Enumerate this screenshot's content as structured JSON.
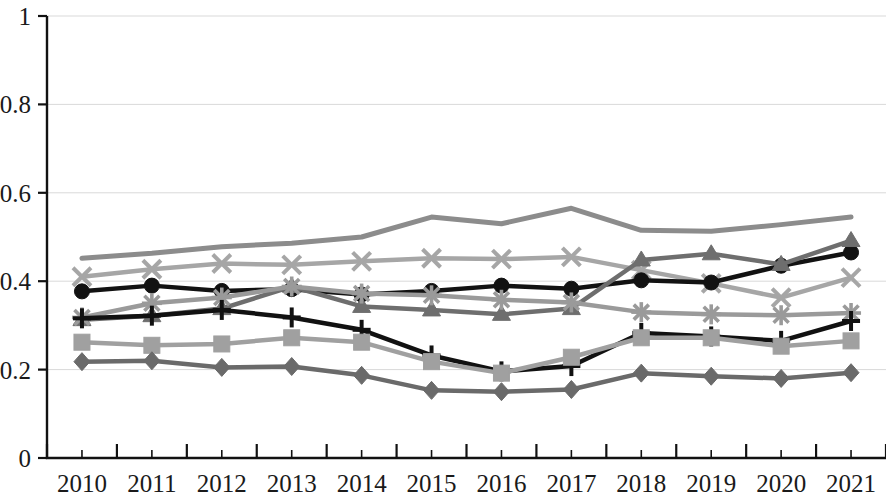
{
  "chart_data": {
    "type": "line",
    "title": "",
    "subtitle": "",
    "xlabel": "",
    "ylabel": "",
    "categories": [
      "2010",
      "2011",
      "2012",
      "2013",
      "2014",
      "2015",
      "2016",
      "2017",
      "2018",
      "2019",
      "2020",
      "2021"
    ],
    "x": [
      2010,
      2011,
      2012,
      2013,
      2014,
      2015,
      2016,
      2017,
      2018,
      2019,
      2020,
      2021
    ],
    "ylim": [
      0,
      1
    ],
    "xlim": [
      2009.5,
      2021.5
    ],
    "y_ticks": [
      0,
      0.2,
      0.4,
      0.6,
      0.8,
      1
    ],
    "y_tick_labels": [
      "0",
      "0.2",
      "0.4",
      "0.6",
      "0.8",
      "1"
    ],
    "grid": "horizontal",
    "legend": "none",
    "series": [
      {
        "name": "series-top-gray-nomarker",
        "marker": "none",
        "color": "#8c8c8c",
        "width": 5,
        "values": [
          0.452,
          0.463,
          0.478,
          0.486,
          0.5,
          0.545,
          0.53,
          0.565,
          0.515,
          0.513,
          0.528,
          0.545
        ]
      },
      {
        "name": "series-x-lightgray",
        "marker": "x",
        "color": "#a6a6a6",
        "width": 4.5,
        "values": [
          0.41,
          0.427,
          0.44,
          0.437,
          0.445,
          0.452,
          0.45,
          0.455,
          0.425,
          0.395,
          0.363,
          0.408
        ]
      },
      {
        "name": "series-circle-black",
        "marker": "circle",
        "color": "#121212",
        "width": 4.5,
        "values": [
          0.377,
          0.39,
          0.378,
          0.382,
          0.37,
          0.378,
          0.39,
          0.383,
          0.402,
          0.397,
          0.435,
          0.465
        ]
      },
      {
        "name": "series-triangle-darkgray",
        "marker": "triangle",
        "color": "#6e6e6e",
        "width": 4.5,
        "values": [
          0.313,
          0.322,
          0.338,
          0.388,
          0.343,
          0.335,
          0.325,
          0.338,
          0.448,
          0.462,
          0.438,
          0.492
        ]
      },
      {
        "name": "series-star-gray",
        "marker": "star",
        "color": "#9a9a9a",
        "width": 4.5,
        "values": [
          0.318,
          0.35,
          0.363,
          0.388,
          0.372,
          0.368,
          0.358,
          0.352,
          0.33,
          0.325,
          0.323,
          0.328
        ]
      },
      {
        "name": "series-plus-black",
        "marker": "plus",
        "color": "#111111",
        "width": 4.5,
        "values": [
          0.316,
          0.322,
          0.335,
          0.318,
          0.29,
          0.232,
          0.196,
          0.208,
          0.283,
          0.275,
          0.265,
          0.31
        ]
      },
      {
        "name": "series-square-gray",
        "marker": "square",
        "color": "#a0a0a0",
        "width": 4.5,
        "values": [
          0.262,
          0.255,
          0.258,
          0.272,
          0.262,
          0.218,
          0.192,
          0.228,
          0.272,
          0.272,
          0.253,
          0.265
        ]
      },
      {
        "name": "series-diamond-darkgray",
        "marker": "diamond",
        "color": "#6a6a6a",
        "width": 4.5,
        "values": [
          0.218,
          0.22,
          0.205,
          0.207,
          0.187,
          0.153,
          0.15,
          0.155,
          0.192,
          0.185,
          0.18,
          0.193
        ]
      }
    ]
  },
  "axes": {
    "y_labels": [
      "1",
      "0.8",
      "0.6",
      "0.4",
      "0.2",
      "0"
    ],
    "x_labels": [
      "2010",
      "2011",
      "2012",
      "2013",
      "2014",
      "2015",
      "2016",
      "2017",
      "2018",
      "2019",
      "2020",
      "2021"
    ]
  },
  "colors": {
    "background": "#ffffff",
    "axis": "#111111",
    "grid": "#d9d9d9",
    "text": "#1a1a1a"
  }
}
